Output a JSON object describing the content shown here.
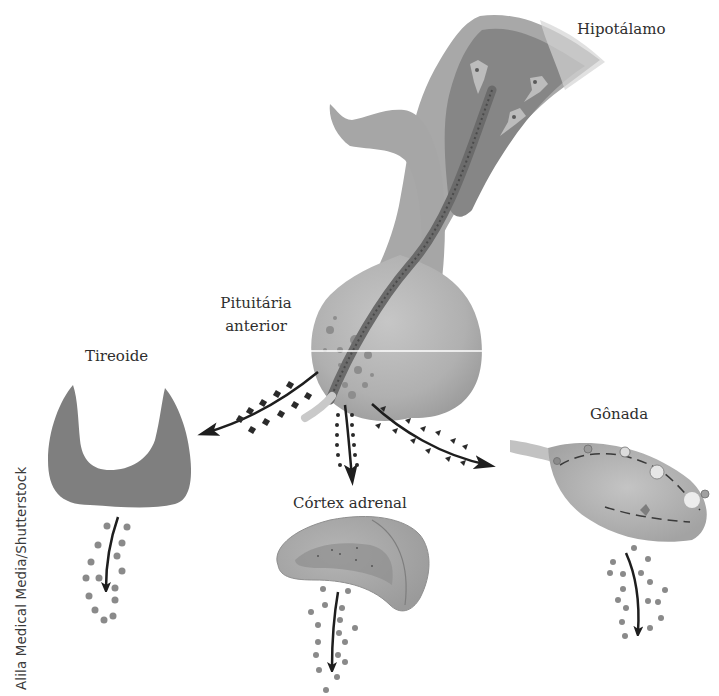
{
  "diagram": {
    "type": "endocrine-axis-illustration",
    "colors": {
      "background": "#ffffff",
      "tissue_light": "#b9b9b9",
      "tissue_mid": "#9a9a9a",
      "tissue_dark": "#7a7a7a",
      "thyroid": "#7d7d7d",
      "arrow": "#1e1e1e",
      "hormone_dots": "#8a8a8a",
      "text": "#2e2e2e"
    },
    "labels": {
      "hypothalamus": "Hipotálamo",
      "anterior_pituitary_line1": "Pituitária",
      "anterior_pituitary_line2": "anterior",
      "thyroid": "Tireoide",
      "adrenal_cortex": "Córtex adrenal",
      "gonad": "Gônada"
    },
    "nodes": [
      {
        "id": "hypothalamus",
        "label": "Hipotálamo"
      },
      {
        "id": "anterior-pituitary",
        "label": "Pituitária anterior"
      },
      {
        "id": "thyroid",
        "label": "Tireoide"
      },
      {
        "id": "adrenal-cortex",
        "label": "Córtex adrenal"
      },
      {
        "id": "gonad",
        "label": "Gônada"
      }
    ],
    "edges": [
      {
        "from": "hypothalamus",
        "to": "anterior-pituitary",
        "marker": "portal-vessel"
      },
      {
        "from": "anterior-pituitary",
        "to": "thyroid",
        "marker": "squares"
      },
      {
        "from": "anterior-pituitary",
        "to": "adrenal-cortex",
        "marker": "small-dots"
      },
      {
        "from": "anterior-pituitary",
        "to": "gonad",
        "marker": "triangles"
      },
      {
        "from": "thyroid",
        "to": "output",
        "marker": "grey-dots"
      },
      {
        "from": "adrenal-cortex",
        "to": "output",
        "marker": "grey-dots"
      },
      {
        "from": "gonad",
        "to": "output",
        "marker": "grey-dots"
      }
    ]
  },
  "credit": "Alila Medical Media/Shutterstock"
}
